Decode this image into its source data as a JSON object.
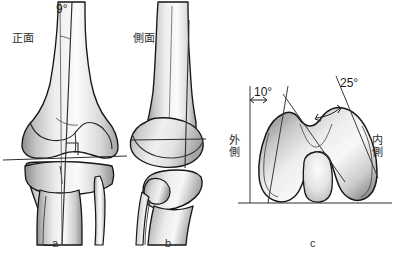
{
  "figure": {
    "background_color": "#ffffff",
    "bone_fill_light": "#f2f2f2",
    "bone_fill_mid": "#c9c9c9",
    "bone_fill_dark": "#9a9a9a",
    "outline_color": "#1a1a1a",
    "axis_line_color": "#3a3a3a"
  },
  "panels": [
    {
      "id": "a",
      "panel_label": "a",
      "view_label": "正面",
      "angle_label": "9°",
      "description": "anterior-view-knee"
    },
    {
      "id": "b",
      "panel_label": "b",
      "view_label": "側面",
      "description": "lateral-view-knee"
    },
    {
      "id": "c",
      "panel_label": "c",
      "angle_label_left": "10°",
      "angle_label_right": "25°",
      "side_label_left": "外側",
      "side_label_right": "内側",
      "description": "distal-femur-axial-view"
    }
  ]
}
